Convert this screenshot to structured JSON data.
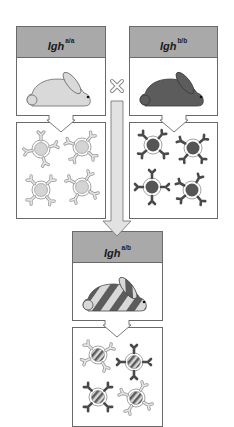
{
  "diagram": {
    "parents": [
      {
        "label_base": "Igh",
        "label_sup": "a/a",
        "rabbit_color": "#d9d9d9",
        "cell_core_color": "#d4d4d4",
        "antibody_color": "#d0d0d0"
      },
      {
        "label_base": "Igh",
        "label_sup": "b/b",
        "rabbit_color": "#5c5c5c",
        "cell_core_color": "#555555",
        "antibody_color": "#555555"
      }
    ],
    "cross_symbol": "×",
    "offspring": {
      "label_base": "Igh",
      "label_sup": "a/b",
      "rabbit_stripe_light": "#d9d9d9",
      "rabbit_stripe_dark": "#5c5c5c",
      "cell_count": 4,
      "cell_antibody_types": [
        "a",
        "b",
        "b",
        "a"
      ]
    },
    "colors": {
      "header_fill": "#a9a9a9",
      "border": "#6a6a6a",
      "arrow_fill": "#e2e2e2"
    }
  }
}
